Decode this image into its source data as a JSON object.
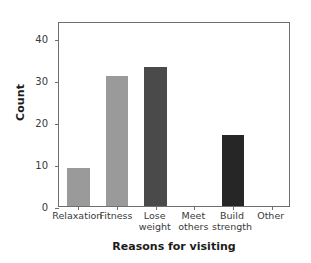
{
  "chart_data": {
    "type": "bar",
    "title": "",
    "xlabel": "Reasons for visiting",
    "ylabel": "Count",
    "categories": [
      "Relaxation",
      "Fitness",
      "Lose weight",
      "Meet others",
      "Build strength",
      "Other"
    ],
    "category_lines": [
      [
        "Relaxation"
      ],
      [
        "Fitness"
      ],
      [
        "Lose",
        "weight"
      ],
      [
        "Meet",
        "others"
      ],
      [
        "Build",
        "strength"
      ],
      [
        "Other"
      ]
    ],
    "values": [
      9,
      31,
      33,
      0,
      17,
      0
    ],
    "bar_colors": [
      "#9a9a9a",
      "#9a9a9a",
      "#4a4a4a",
      "#9a9a9a",
      "#262626",
      "#9a9a9a"
    ],
    "ylim": [
      0,
      44
    ],
    "yticks": [
      0,
      10,
      20,
      30,
      40
    ],
    "ytick_labels": [
      "0",
      "10",
      "20",
      "30",
      "40"
    ],
    "grid": false,
    "legend": "none",
    "frame_color": "#6e6e6e",
    "background": "#ffffff"
  }
}
